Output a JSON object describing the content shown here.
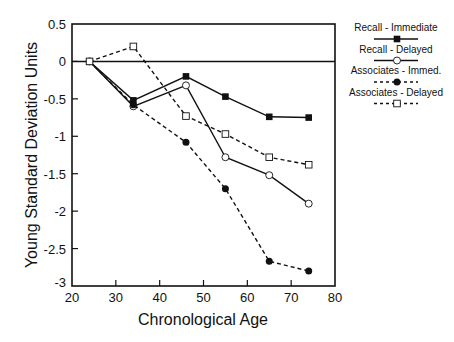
{
  "chart_data": {
    "type": "line",
    "title": "",
    "xlabel": "Chronological Age",
    "ylabel": "Young Standard Deviation Units",
    "xlim": [
      20,
      80
    ],
    "ylim": [
      -3,
      0.5
    ],
    "xticks": [
      20,
      30,
      40,
      50,
      60,
      70,
      80
    ],
    "yticks": [
      0.5,
      0,
      -0.5,
      -1,
      -1.5,
      -2,
      -2.5,
      -3
    ],
    "xtick_labels": [
      "20",
      "30",
      "40",
      "50",
      "60",
      "70",
      "80"
    ],
    "ytick_labels": [
      "0.5",
      "0",
      "-0.5",
      "-1",
      "-1.5",
      "-2",
      "-2.5",
      "-3"
    ],
    "grid": false,
    "reference_line": 0,
    "legend_position": "right-outside-top",
    "x": [
      24,
      34,
      46,
      55,
      65,
      74
    ],
    "series": [
      {
        "name": "Recall - Immediate",
        "line": "solid",
        "marker": "filled-square",
        "values": [
          0,
          -0.52,
          -0.2,
          -0.47,
          -0.74,
          -0.75
        ]
      },
      {
        "name": "Recall - Delayed",
        "line": "solid",
        "marker": "open-circle",
        "values": [
          0,
          -0.6,
          -0.32,
          -1.28,
          -1.52,
          -1.9
        ]
      },
      {
        "name": "Associates - Immed.",
        "line": "dashed",
        "marker": "filled-circle",
        "values": [
          0,
          -0.58,
          -1.08,
          -1.7,
          -2.67,
          -2.8
        ]
      },
      {
        "name": "Associates - Delayed",
        "line": "dashed",
        "marker": "open-square",
        "values": [
          0,
          0.2,
          -0.73,
          -0.97,
          -1.28,
          -1.38
        ]
      }
    ]
  }
}
